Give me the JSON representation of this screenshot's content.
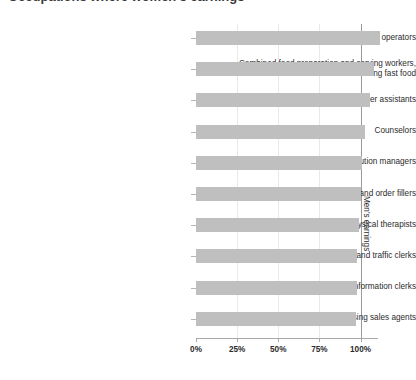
{
  "chart": {
    "title_partial": "Occupations where women's earnings",
    "annotation": "Men's earnings",
    "bar_color": "#bfbfbf",
    "reference_line_color": "#9a9a9a",
    "gridline_color": "#e9e9e9"
  },
  "chart_data": {
    "type": "bar",
    "orientation": "horizontal",
    "title": "Occupations where women's earnings",
    "xlabel": "",
    "ylabel": "",
    "xlim": [
      0,
      110
    ],
    "xticks": [
      0,
      25,
      50,
      75,
      100
    ],
    "xtick_labels": [
      "0%",
      "25%",
      "50%",
      "75%",
      "100%"
    ],
    "grid": true,
    "legend": false,
    "annotations": [
      "Men's earnings"
    ],
    "reference_line": 100,
    "categories": [
      "Sewing machine operators",
      "Combined food preparation and serving workers, including fast food",
      "Teacher assistants",
      "Counselors",
      "Transportation, storage, and distribution managers",
      "Stock clerks and order fillers",
      "Physical therapists",
      "Shipping, receiving, and traffic clerks",
      "Receptionists and information clerks",
      "Advertising sales agents"
    ],
    "values": [
      112,
      108,
      106,
      103,
      101,
      100,
      99,
      98,
      98,
      97
    ],
    "value_unit": "percent of men's earnings"
  }
}
